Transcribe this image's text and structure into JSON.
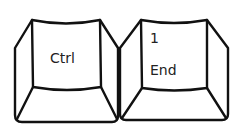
{
  "keys": [
    {
      "name": "ctrl",
      "primary_label": "Ctrl",
      "secondary_label": ""
    },
    {
      "name": "end",
      "primary_label": "End",
      "secondary_label": "1"
    }
  ],
  "colors": {
    "line": "#111111",
    "background": "#ffffff",
    "text": "#222222"
  }
}
